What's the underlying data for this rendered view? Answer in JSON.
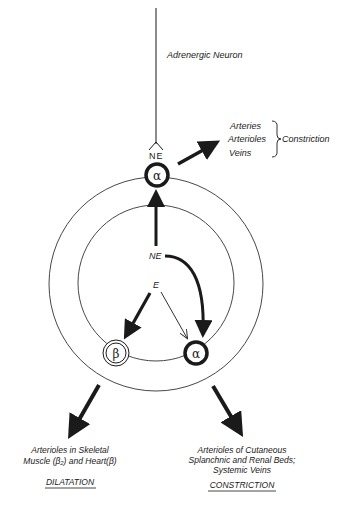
{
  "neuron_label": "Adrenergic Neuron",
  "synapse_label": "NE",
  "top_receptor_symbol": "α",
  "vessels": {
    "items": [
      "Arteries",
      "Arterioles",
      "Veins"
    ],
    "effect": "Constriction"
  },
  "circulating": {
    "ne_label": "NE",
    "e_label": "E"
  },
  "receptors": {
    "beta_symbol": "β",
    "alpha_symbol": "α"
  },
  "left_outcome": {
    "line1": "Arterioles in Skeletal",
    "line2": "Muscle (β₂) and Heart(β)",
    "effect": "DILATATION"
  },
  "right_outcome": {
    "line1": "Arterioles of Cutaneous",
    "line2": "Splanchnic and Renal Beds;",
    "line3": "Systemic Veins",
    "effect": "CONSTRICTION"
  },
  "colors": {
    "ink": "#1a1a1a",
    "background": "#ffffff"
  }
}
